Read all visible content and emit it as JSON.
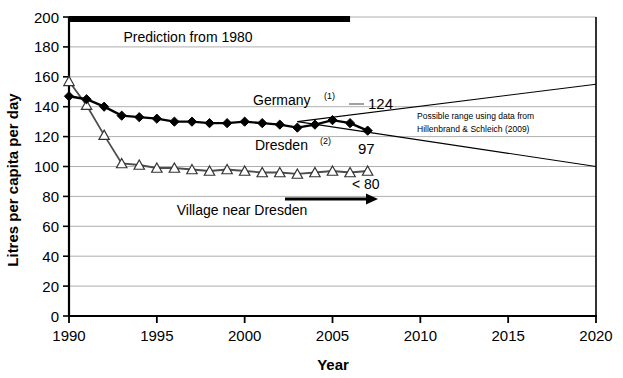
{
  "chart_data": {
    "type": "line",
    "title": "",
    "xlabel": "Year",
    "ylabel": "Litres per capita per day",
    "xlim": [
      1990,
      2020
    ],
    "ylim": [
      0,
      200
    ],
    "xticks": [
      "1990",
      "1995",
      "2000",
      "2005",
      "2010",
      "2015",
      "2020"
    ],
    "yticks": [
      "0",
      "20",
      "40",
      "60",
      "80",
      "100",
      "120",
      "140",
      "160",
      "180",
      "200"
    ],
    "grid": true,
    "legend_position": "inline-annotations",
    "series": [
      {
        "name": "Germany",
        "footnote": "(1)",
        "marker": "filled-diamond",
        "end_value": 124,
        "x": [
          1990,
          1991,
          1992,
          1993,
          1994,
          1995,
          1996,
          1997,
          1998,
          1999,
          2000,
          2001,
          2002,
          2003,
          2004,
          2005,
          2006,
          2007
        ],
        "values": [
          147,
          145,
          140,
          134,
          133,
          132,
          130,
          130,
          129,
          129,
          130,
          129,
          128,
          126,
          128,
          131,
          129,
          124
        ]
      },
      {
        "name": "Dresden",
        "footnote": "(2)",
        "marker": "open-triangle",
        "end_value": 97,
        "x": [
          1990,
          1991,
          1992,
          1993,
          1994,
          1995,
          1996,
          1997,
          1998,
          1999,
          2000,
          2001,
          2002,
          2003,
          2004,
          2005,
          2006,
          2007
        ],
        "values": [
          157,
          141,
          121,
          102,
          101,
          99,
          99,
          98,
          97,
          98,
          97,
          96,
          96,
          95,
          96,
          97,
          96,
          97
        ]
      }
    ],
    "annotations": {
      "prediction_bar": {
        "label": "Prediction from 1980",
        "y": 200,
        "x_start": 1990,
        "x_end": 2006
      },
      "germany_label": "Germany",
      "germany_superscript": "(1)",
      "germany_value": "124",
      "dresden_label": "Dresden",
      "dresden_superscript": "(2)",
      "dresden_value": "97",
      "village_arrow_label": "Village near Dresden",
      "village_threshold": "< 80",
      "possible_range_line1": "Possible range using data from",
      "possible_range_line2": "Hillenbrand & Schleich (2009)",
      "fan_origin": {
        "x": 2003,
        "y": 130
      },
      "fan_upper_end": {
        "x": 2020,
        "y": 155
      },
      "fan_lower_end": {
        "x": 2020,
        "y": 100
      }
    },
    "colors": {
      "axis": "#000000",
      "grid": "#9a9a9a",
      "germany_series": "#000000",
      "dresden_series": "#555555",
      "background": "#ffffff"
    }
  }
}
